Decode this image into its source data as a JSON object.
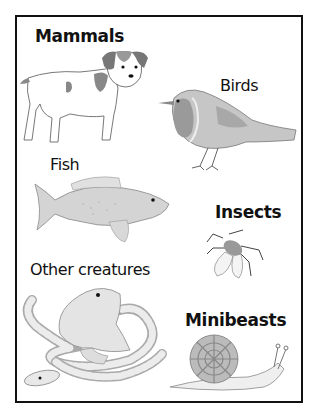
{
  "worksheet": {
    "categories": [
      {
        "id": "mammals",
        "label": "Mammals",
        "style": "bold",
        "example": "dog-illustration"
      },
      {
        "id": "birds",
        "label": "Birds",
        "style": "regular",
        "example": "robin-illustration"
      },
      {
        "id": "fish",
        "label": "Fish",
        "style": "regular",
        "example": "fish-illustration"
      },
      {
        "id": "insects",
        "label": "Insects",
        "style": "bold",
        "example": "fly-illustration"
      },
      {
        "id": "other",
        "label": "Other creatures",
        "style": "regular",
        "example": "frog-and-snake-illustration"
      },
      {
        "id": "minibeasts",
        "label": "Minibeasts",
        "style": "bold",
        "example": "snail-illustration"
      }
    ]
  },
  "colors": {
    "border": "#111111",
    "text": "#111111",
    "background": "#ffffff",
    "robin_breast": "#9a9a9a",
    "shading": "#b8b8b8"
  }
}
